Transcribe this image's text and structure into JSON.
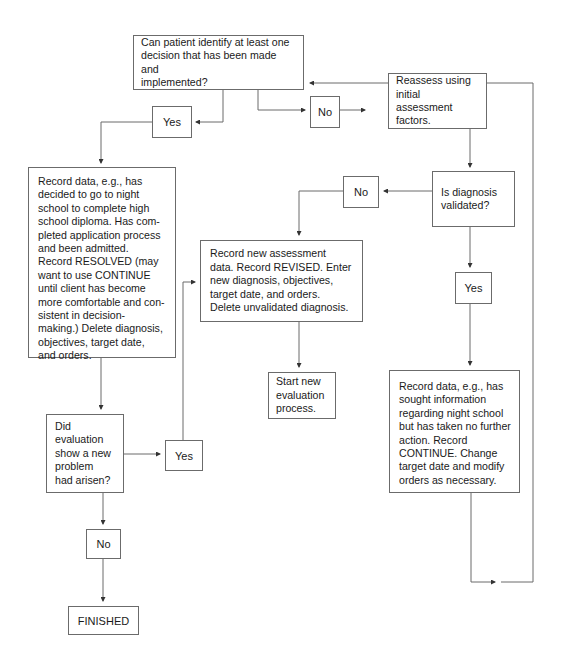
{
  "diagram": {
    "type": "flowchart",
    "line_color": "#6b6b6b",
    "nodes": {
      "q_decision": {
        "text": "Can patient identify at least one\ndecision that has been made and\nimplemented?"
      },
      "no_1": {
        "text": "No"
      },
      "reassess": {
        "text": "Reassess using\ninitial assessment\nfactors."
      },
      "yes_1": {
        "text": "Yes"
      },
      "record_resolved": {
        "text": "Record data, e.g., has\ndecided to go to night\nschool to complete high\nschool diploma. Has com-\npleted application process\nand been admitted.\nRecord RESOLVED (may\nwant to use CONTINUE\nuntil client has become\nmore comfortable and con-\nsistent in decision-\nmaking.) Delete diagnosis,\nobjectives, target date,\nand orders."
      },
      "q_diagnosis": {
        "text": "Is diagnosis\nvalidated?"
      },
      "no_2": {
        "text": "No"
      },
      "record_revised": {
        "text": "Record new assessment\ndata. Record REVISED. Enter\nnew diagnosis, objectives,\ntarget date, and orders.\nDelete unvalidated diagnosis."
      },
      "start_new": {
        "text": "Start new\nevaluation\nprocess."
      },
      "yes_2": {
        "text": "Yes"
      },
      "record_continue": {
        "text": "Record data, e.g., has\nsought information\nregarding night school\nbut has taken no further\naction. Record\nCONTINUE. Change\ntarget date and modify\norders as necessary."
      },
      "q_new_problem": {
        "text": "Did\nevaluation\nshow a new\nproblem\nhad arisen?"
      },
      "yes_3": {
        "text": "Yes"
      },
      "no_3": {
        "text": "No"
      },
      "finished": {
        "text": "FINISHED"
      }
    },
    "edges": [
      [
        "q_decision",
        "yes_1"
      ],
      [
        "yes_1",
        "record_resolved"
      ],
      [
        "q_decision",
        "no_1"
      ],
      [
        "no_1",
        "reassess"
      ],
      [
        "reassess",
        "q_diagnosis"
      ],
      [
        "q_diagnosis",
        "no_2"
      ],
      [
        "no_2",
        "record_revised"
      ],
      [
        "record_revised",
        "start_new"
      ],
      [
        "q_diagnosis",
        "yes_2"
      ],
      [
        "yes_2",
        "record_continue"
      ],
      [
        "record_continue",
        "q_decision"
      ],
      [
        "record_resolved",
        "q_new_problem"
      ],
      [
        "q_new_problem",
        "yes_3"
      ],
      [
        "yes_3",
        "record_revised"
      ],
      [
        "q_new_problem",
        "no_3"
      ],
      [
        "no_3",
        "finished"
      ]
    ]
  }
}
